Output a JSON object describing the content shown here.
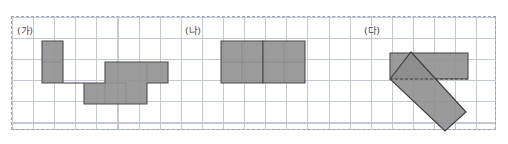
{
  "figure": {
    "width": 508,
    "height": 144,
    "background_color": "#ffffff"
  },
  "grid": {
    "left": 11,
    "top": 16,
    "width": 485,
    "height": 114,
    "cell_size": 21.1,
    "columns": 23,
    "rows": 5,
    "line_color": "#c3c9d2",
    "border_style": "dashed",
    "border_color": "#9aa3ae"
  },
  "style": {
    "shape_fill": "#939393",
    "shape_stroke": "#4d4d4d",
    "rotated_fill": "#8c8c8c",
    "rotated_stroke": "#3f3f3f",
    "label_color": "#4a4a4a"
  },
  "shapes": [
    {
      "id": "shape-ga",
      "label": "(가)",
      "label_x": 17,
      "label_y": 28,
      "type": "polyomino",
      "cells": 8,
      "points": "42,41 63,41 63,83 84,83 84,104 147,104 147,83 105,83 105,62 147,62 147,83 168,83 168,62 147,62 147,83"
    },
    {
      "id": "shape-na",
      "label": "(나)",
      "label_x": 185,
      "label_y": 28,
      "type": "polyomino",
      "cells": 10,
      "points": "221,62 221,41 263,41 263,83 305,83 305,41 263,41"
    },
    {
      "id": "shape-da",
      "label": "(다)",
      "label_x": 364,
      "label_y": 28,
      "type": "rectangle-pair",
      "rect_horizontal": {
        "x": 390,
        "y": 53,
        "width": 78,
        "height": 26
      },
      "rect_rotated": {
        "points": "390,79 411,52 466,112 445,131"
      }
    }
  ]
}
